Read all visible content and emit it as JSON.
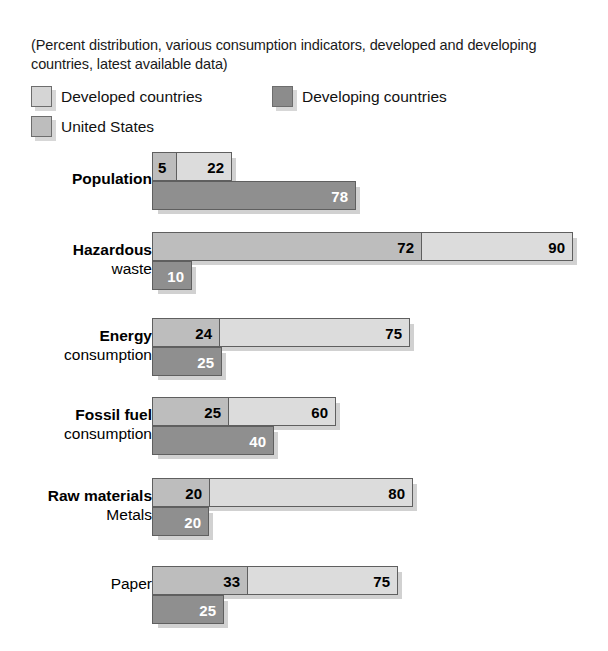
{
  "subtitle": "(Percent distribution, various consumption indicators, developed and developing countries, latest available data)",
  "legend": {
    "developed": "Developed countries",
    "developing": "Developing countries",
    "united_states": "United States"
  },
  "colors": {
    "developed": "#dcdcdc",
    "developing": "#8f8f8f",
    "united_states": "#bdbdbd",
    "outline": "#5f5f5f",
    "background": "#ffffff",
    "text": "#000000"
  },
  "chart_data": {
    "type": "bar",
    "orientation": "horizontal",
    "title": "",
    "subtitle": "(Percent distribution, various consumption indicators, developed and developing countries, latest available data)",
    "xlabel": "",
    "ylabel": "",
    "grid": false,
    "legend_position": "top-left",
    "units": "percent",
    "note": "Each category row is drawn to its own proportional scale; bars are overlapping (United States segment nested inside the Developed countries bar).",
    "categories": [
      "Population",
      "Hazardous waste",
      "Energy consumption",
      "Fossil fuel consumption",
      "Raw materials / Metals",
      "Paper"
    ],
    "series": [
      {
        "name": "United States",
        "values": [
          5,
          72,
          24,
          25,
          20,
          33
        ]
      },
      {
        "name": "Developed countries",
        "values": [
          22,
          90,
          75,
          60,
          80,
          75
        ]
      },
      {
        "name": "Developing countries",
        "values": [
          78,
          10,
          25,
          40,
          20,
          25
        ]
      }
    ]
  },
  "rows": [
    {
      "name": "population",
      "label": "Population",
      "sub_label": "",
      "bold": true,
      "top": 152,
      "label_top": 18,
      "us": {
        "value": "5",
        "width": 24,
        "label_color": "dark",
        "label_pos": "left"
      },
      "developed": {
        "value": "22",
        "width": 80,
        "label_color": "dark"
      },
      "developing": {
        "value": "78",
        "width": 204,
        "label_color": "light"
      }
    },
    {
      "name": "hazardous-waste",
      "label": "Hazardous",
      "sub_label": "waste",
      "bold": true,
      "top": 232,
      "label_top": 9,
      "us": {
        "value": "72",
        "width": 269,
        "label_color": "dark",
        "label_pos": "right"
      },
      "developed": {
        "value": "90",
        "width": 421,
        "label_color": "dark"
      },
      "developing": {
        "value": "10",
        "width": 40,
        "label_color": "light"
      }
    },
    {
      "name": "energy-consumption",
      "label": "Energy",
      "sub_label": "consumption",
      "bold": true,
      "top": 318,
      "label_top": 9,
      "us": {
        "value": "24",
        "width": 67,
        "label_color": "dark",
        "label_pos": "right"
      },
      "developed": {
        "value": "75",
        "width": 258,
        "label_color": "dark"
      },
      "developing": {
        "value": "25",
        "width": 70,
        "label_color": "light"
      }
    },
    {
      "name": "fossil-fuel-consumption",
      "label": "Fossil fuel",
      "sub_label": "consumption",
      "bold": true,
      "top": 397,
      "label_top": 9,
      "us": {
        "value": "25",
        "width": 76,
        "label_color": "dark",
        "label_pos": "right"
      },
      "developed": {
        "value": "60",
        "width": 184,
        "label_color": "dark"
      },
      "developing": {
        "value": "40",
        "width": 122,
        "label_color": "light"
      }
    },
    {
      "name": "raw-materials-metals",
      "label": "Raw materials",
      "sub_label": "Metals",
      "bold": true,
      "top": 478,
      "label_top": 9,
      "us": {
        "value": "20",
        "width": 57,
        "label_color": "dark",
        "label_pos": "right"
      },
      "developed": {
        "value": "80",
        "width": 261,
        "label_color": "dark"
      },
      "developing": {
        "value": "20",
        "width": 57,
        "label_color": "light"
      }
    },
    {
      "name": "paper",
      "label": "",
      "sub_label": "Paper",
      "bold": false,
      "top": 566,
      "label_top": 9,
      "us": {
        "value": "33",
        "width": 95,
        "label_color": "dark",
        "label_pos": "right"
      },
      "developed": {
        "value": "75",
        "width": 246,
        "label_color": "dark"
      },
      "developing": {
        "value": "25",
        "width": 72,
        "label_color": "light"
      }
    }
  ]
}
